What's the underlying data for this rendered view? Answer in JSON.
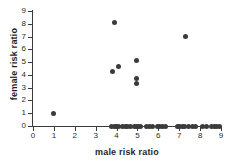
{
  "chart_data": {
    "type": "scatter",
    "title": "",
    "xlabel": "male risk ratio",
    "ylabel": "female risk ratio",
    "xlim": [
      0,
      9
    ],
    "ylim": [
      0,
      9
    ],
    "xticks": [
      0,
      1,
      2,
      3,
      4,
      5,
      6,
      7,
      8,
      9
    ],
    "yticks": [
      0,
      1,
      2,
      3,
      4,
      5,
      6,
      7,
      8,
      9
    ],
    "grid": false,
    "legend": null,
    "marker": {
      "shape": "circle",
      "color": "#3b3b3b",
      "size": 5
    },
    "points": [
      {
        "x": 1.0,
        "y": 1.0
      },
      {
        "x": 3.9,
        "y": 8.1
      },
      {
        "x": 3.8,
        "y": 4.25
      },
      {
        "x": 4.1,
        "y": 4.65
      },
      {
        "x": 4.95,
        "y": 5.1
      },
      {
        "x": 4.95,
        "y": 3.75
      },
      {
        "x": 4.95,
        "y": 3.3
      },
      {
        "x": 7.3,
        "y": 7.0
      },
      {
        "x": 3.78,
        "y": 0
      },
      {
        "x": 3.9,
        "y": 0
      },
      {
        "x": 4.0,
        "y": 0
      },
      {
        "x": 4.1,
        "y": 0
      },
      {
        "x": 4.3,
        "y": 0
      },
      {
        "x": 4.42,
        "y": 0
      },
      {
        "x": 4.54,
        "y": 0
      },
      {
        "x": 4.68,
        "y": 0
      },
      {
        "x": 4.85,
        "y": 0
      },
      {
        "x": 4.95,
        "y": 0
      },
      {
        "x": 5.05,
        "y": 0
      },
      {
        "x": 5.15,
        "y": 0
      },
      {
        "x": 5.45,
        "y": 0
      },
      {
        "x": 5.58,
        "y": 0
      },
      {
        "x": 5.72,
        "y": 0
      },
      {
        "x": 5.95,
        "y": 0
      },
      {
        "x": 6.05,
        "y": 0
      },
      {
        "x": 6.18,
        "y": 0
      },
      {
        "x": 6.35,
        "y": 0
      },
      {
        "x": 6.9,
        "y": 0
      },
      {
        "x": 7.02,
        "y": 0
      },
      {
        "x": 7.14,
        "y": 0
      },
      {
        "x": 7.26,
        "y": 0
      },
      {
        "x": 7.45,
        "y": 0
      },
      {
        "x": 7.62,
        "y": 0
      },
      {
        "x": 7.78,
        "y": 0
      },
      {
        "x": 8.1,
        "y": 0
      },
      {
        "x": 8.3,
        "y": 0
      },
      {
        "x": 8.55,
        "y": 0
      },
      {
        "x": 8.68,
        "y": 0
      },
      {
        "x": 8.8,
        "y": 0
      },
      {
        "x": 8.92,
        "y": 0
      }
    ]
  }
}
